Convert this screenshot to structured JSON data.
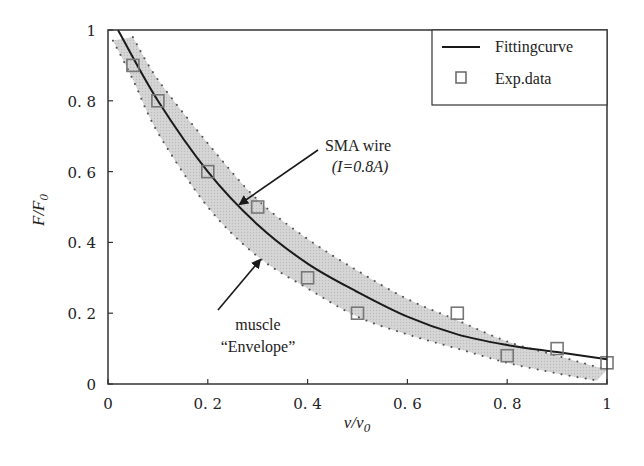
{
  "chart_data": {
    "type": "line",
    "title": "",
    "xlabel": "v/v0",
    "ylabel": "F/F0",
    "xlim": [
      0,
      1
    ],
    "ylim": [
      0,
      1
    ],
    "grid": false,
    "legend_position": "upper right",
    "x_ticks": [
      "0",
      "0.2",
      "0.4",
      "0.6",
      "0.8",
      "1"
    ],
    "y_ticks": [
      "0",
      "0.2",
      "0.4",
      "0.6",
      "0.8",
      "1"
    ],
    "series": [
      {
        "name": "Fittingcurve",
        "kind": "line",
        "color": "#1a1a1a",
        "x": [
          0.02,
          0.1,
          0.2,
          0.3,
          0.4,
          0.5,
          0.6,
          0.7,
          0.8,
          0.9,
          1.0
        ],
        "y": [
          1.0,
          0.8,
          0.6,
          0.45,
          0.34,
          0.26,
          0.19,
          0.14,
          0.11,
          0.09,
          0.07
        ]
      },
      {
        "name": "Exp.data",
        "kind": "scatter",
        "marker": "square",
        "color": "#777777",
        "x": [
          0.05,
          0.1,
          0.2,
          0.3,
          0.4,
          0.5,
          0.7,
          0.8,
          0.9,
          1.0
        ],
        "y": [
          0.9,
          0.8,
          0.6,
          0.5,
          0.3,
          0.2,
          0.2,
          0.08,
          0.1,
          0.06
        ]
      },
      {
        "name": "muscle Envelope (upper)",
        "kind": "band-edge",
        "color": "#666666",
        "x": [
          0.05,
          0.1,
          0.2,
          0.3,
          0.4,
          0.5,
          0.6,
          0.7,
          0.8,
          0.9,
          1.0
        ],
        "y": [
          0.98,
          0.86,
          0.68,
          0.52,
          0.41,
          0.32,
          0.24,
          0.18,
          0.12,
          0.08,
          0.04
        ]
      },
      {
        "name": "muscle Envelope (lower)",
        "kind": "band-edge",
        "color": "#666666",
        "x": [
          0.01,
          0.05,
          0.1,
          0.2,
          0.3,
          0.4,
          0.5,
          0.6,
          0.7,
          0.8,
          0.9,
          0.98
        ],
        "y": [
          0.97,
          0.86,
          0.71,
          0.5,
          0.36,
          0.27,
          0.19,
          0.14,
          0.1,
          0.06,
          0.03,
          0.01
        ]
      }
    ],
    "band_fill": "#d4d4d4",
    "annotations": [
      {
        "line1": "SMA wire",
        "line2": "(I=0.8A)",
        "arrow_to": [
          0.26,
          0.49
        ]
      },
      {
        "line1": "muscle",
        "line2": "“Envelope”",
        "arrow_to": [
          0.3,
          0.4
        ]
      }
    ]
  },
  "legend": {
    "items": [
      {
        "label": "Fittingcurve",
        "symbol": "line"
      },
      {
        "label": "Exp.data",
        "symbol": "square"
      }
    ]
  },
  "axes": {
    "x_label_main": "v/v",
    "x_label_sub": "0",
    "y_label_main": "F/F",
    "y_label_sub": "0"
  },
  "annotations": {
    "sma_line1": "SMA wire",
    "sma_line2": "(I=0.8A)",
    "muscle_line1": "muscle",
    "muscle_line2": "“Envelope”"
  }
}
